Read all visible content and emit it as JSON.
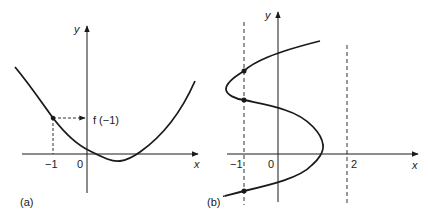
{
  "panel_a": {
    "caption": "(a)",
    "x_label": "x",
    "y_label": "y",
    "ticks": [
      "−1",
      "0"
    ],
    "annotation": "f (−1)",
    "description": "Graph of a function y = f(x) (upward parabola-like curve); point at x = −1 with dashed guide to its value f(−1) on the y-axis"
  },
  "panel_b": {
    "caption": "(b)",
    "x_label": "x",
    "y_label": "y",
    "ticks": [
      "−1",
      "0",
      "2"
    ],
    "description": "S-shaped curve that is not a function of x; vertical dashed line x = −1 meets the curve at three points; dashed line at x = 2"
  },
  "colors": {
    "ink": "#1a1a1a",
    "background": "#ffffff"
  }
}
